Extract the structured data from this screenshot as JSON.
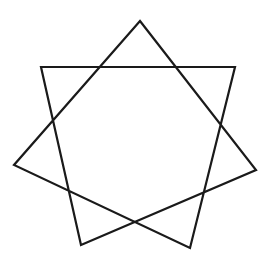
{
  "figure": {
    "shape": "heptagram",
    "schlafli": "{7/2}",
    "stroke_color": "#1a1a1a",
    "fill_color": "none",
    "background": "#ffffff",
    "stroke_width": 2.2,
    "vertices": [
      {
        "name": "top",
        "x": 140,
        "y": 21
      },
      {
        "name": "upper-right",
        "x": 235,
        "y": 67
      },
      {
        "name": "right",
        "x": 256,
        "y": 170
      },
      {
        "name": "bottom-right",
        "x": 190,
        "y": 248
      },
      {
        "name": "bottom-left",
        "x": 81,
        "y": 245
      },
      {
        "name": "left",
        "x": 14,
        "y": 165
      },
      {
        "name": "upper-left",
        "x": 41,
        "y": 67
      }
    ],
    "path_order": [
      "top",
      "right",
      "bottom-left",
      "upper-left",
      "upper-right",
      "bottom-right",
      "left",
      "top"
    ]
  }
}
